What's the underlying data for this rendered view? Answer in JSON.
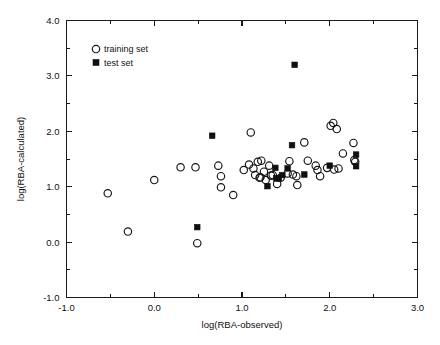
{
  "figure": {
    "background_color": "#ffffff",
    "foreground_color": "#111111"
  },
  "chart_data": {
    "type": "scatter",
    "title": "",
    "xlabel": "log(RBA-observed)",
    "ylabel": "log(RBA-calculated)",
    "xlim": [
      -1.0,
      3.0
    ],
    "ylim": [
      -1.0,
      4.0
    ],
    "grid": false,
    "xticks": [
      -1.0,
      0.0,
      1.0,
      2.0,
      3.0
    ],
    "xtick_labels": [
      "-1.0",
      "0.0",
      "1.0",
      "2.0",
      "3.0"
    ],
    "xminor_ticks": [
      -0.5,
      0.5,
      1.5,
      2.5
    ],
    "yticks": [
      -1.0,
      0.0,
      1.0,
      2.0,
      3.0,
      4.0
    ],
    "ytick_labels": [
      "-1.0",
      "0.0",
      "1.0",
      "2.0",
      "3.0",
      "4.0"
    ],
    "yminor_ticks": [
      -0.5,
      0.5,
      1.5,
      2.5,
      3.5
    ],
    "legend_position": "upper-left",
    "series": [
      {
        "name": "training set",
        "marker": "open-circle",
        "marker_size": 5.2,
        "color": "#151515",
        "points": [
          [
            -0.53,
            0.88
          ],
          [
            -0.3,
            0.19
          ],
          [
            0.0,
            1.12
          ],
          [
            0.3,
            1.35
          ],
          [
            0.47,
            1.35
          ],
          [
            0.49,
            -0.02
          ],
          [
            0.73,
            1.38
          ],
          [
            0.76,
            1.19
          ],
          [
            0.76,
            0.99
          ],
          [
            0.9,
            0.85
          ],
          [
            1.02,
            1.3
          ],
          [
            1.08,
            1.4
          ],
          [
            1.1,
            1.98
          ],
          [
            1.13,
            1.33
          ],
          [
            1.15,
            1.21
          ],
          [
            1.18,
            1.45
          ],
          [
            1.2,
            1.16
          ],
          [
            1.21,
            1.17
          ],
          [
            1.22,
            1.47
          ],
          [
            1.25,
            1.27
          ],
          [
            1.27,
            1.12
          ],
          [
            1.31,
            1.38
          ],
          [
            1.33,
            1.2
          ],
          [
            1.35,
            1.21
          ],
          [
            1.4,
            1.05
          ],
          [
            1.44,
            1.16
          ],
          [
            1.52,
            1.24
          ],
          [
            1.54,
            1.46
          ],
          [
            1.58,
            1.22
          ],
          [
            1.62,
            1.19
          ],
          [
            1.63,
            1.03
          ],
          [
            1.71,
            1.8
          ],
          [
            1.75,
            1.47
          ],
          [
            1.84,
            1.38
          ],
          [
            1.86,
            1.3
          ],
          [
            1.89,
            1.19
          ],
          [
            1.97,
            1.34
          ],
          [
            2.01,
            2.1
          ],
          [
            2.04,
            2.15
          ],
          [
            2.05,
            1.31
          ],
          [
            2.08,
            2.04
          ],
          [
            2.1,
            1.33
          ],
          [
            2.15,
            1.6
          ],
          [
            2.27,
            1.79
          ],
          [
            2.28,
            1.48
          ],
          [
            2.29,
            1.45
          ]
        ]
      },
      {
        "name": "test set",
        "marker": "filled-square",
        "marker_size": 5.6,
        "color": "#101010",
        "points": [
          [
            0.49,
            0.27
          ],
          [
            0.66,
            1.92
          ],
          [
            1.29,
            1.01
          ],
          [
            1.38,
            1.34
          ],
          [
            1.39,
            1.15
          ],
          [
            1.42,
            1.15
          ],
          [
            1.46,
            1.21
          ],
          [
            1.52,
            1.33
          ],
          [
            1.57,
            1.75
          ],
          [
            1.6,
            3.2
          ],
          [
            1.71,
            1.22
          ],
          [
            2.0,
            1.38
          ],
          [
            2.3,
            1.58
          ],
          [
            2.3,
            1.37
          ]
        ]
      }
    ]
  },
  "legend": {
    "items": [
      {
        "label": "training set",
        "marker": "open-circle"
      },
      {
        "label": "test set",
        "marker": "filled-square"
      }
    ]
  }
}
